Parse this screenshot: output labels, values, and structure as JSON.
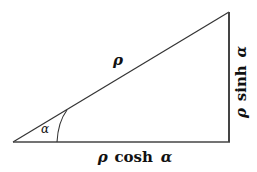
{
  "diagram": {
    "type": "right-triangle",
    "stroke_color": "#333333",
    "hypotenuse_label": "ρ",
    "adjacent_label_rho": "ρ",
    "adjacent_label_func": "cosh",
    "adjacent_label_arg": "α",
    "opposite_label_rho": "ρ",
    "opposite_label_func": "sinh",
    "opposite_label_arg": "α",
    "angle_label": "α"
  }
}
